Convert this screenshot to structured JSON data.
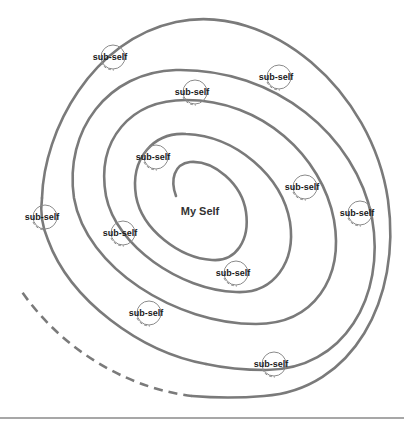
{
  "diagram": {
    "type": "spiral",
    "center_label": "My Self",
    "node_label": "sub-self",
    "colors": {
      "spiral": "#7a7a7a",
      "node_circle": "#8a8a8a",
      "text": "#1a1a1a",
      "rule": "#8a8a8a",
      "background": "#ffffff"
    },
    "nodes": [
      {
        "label": "sub-self",
        "x": 110,
        "y": 57
      },
      {
        "label": "sub-self",
        "x": 276,
        "y": 77
      },
      {
        "label": "sub-self",
        "x": 192,
        "y": 92
      },
      {
        "label": "sub-self",
        "x": 153,
        "y": 157
      },
      {
        "label": "sub-self",
        "x": 302,
        "y": 187
      },
      {
        "label": "sub-self",
        "x": 42,
        "y": 217
      },
      {
        "label": "sub-self",
        "x": 357,
        "y": 213
      },
      {
        "label": "sub-self",
        "x": 120,
        "y": 233
      },
      {
        "label": "sub-self",
        "x": 233,
        "y": 273
      },
      {
        "label": "sub-self",
        "x": 146,
        "y": 313
      },
      {
        "label": "sub-self",
        "x": 271,
        "y": 364
      }
    ]
  }
}
